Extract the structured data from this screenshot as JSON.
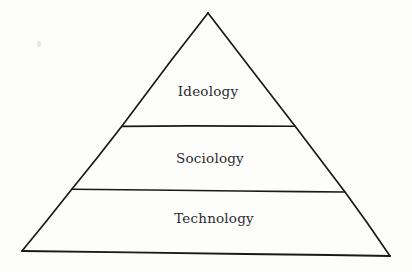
{
  "diagram": {
    "type": "pyramid",
    "title": "",
    "orientation": "apex-up",
    "tier_count": 3,
    "style": {
      "background_color": "#fdfdfc",
      "stroke_color": "#1a1a1a",
      "text_color": "#2b2b2b",
      "fill_color": "none"
    },
    "geometry": {
      "apex": {
        "x": 208,
        "y": 13
      },
      "bottom_left": {
        "x": 22,
        "y": 251
      },
      "bottom_right": {
        "x": 390,
        "y": 256
      },
      "divider_1": {
        "x1": 122,
        "y1": 126,
        "x2": 295,
        "y2": 126
      },
      "divider_2": {
        "x1": 72,
        "y1": 189,
        "x2": 345,
        "y2": 192
      }
    },
    "tiers": [
      {
        "rank": 1,
        "position": "top",
        "label": "Ideology",
        "center": {
          "x": 208,
          "y": 92
        }
      },
      {
        "rank": 2,
        "position": "middle",
        "label": "Sociology",
        "center": {
          "x": 210,
          "y": 159
        }
      },
      {
        "rank": 3,
        "position": "bottom",
        "label": "Technology",
        "center": {
          "x": 214,
          "y": 219
        }
      }
    ]
  }
}
